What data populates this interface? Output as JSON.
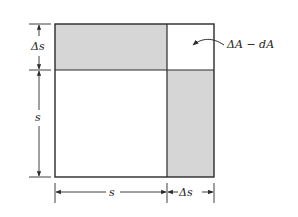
{
  "figure": {
    "colors": {
      "line": "#2a2a2a",
      "shade": "#d6d6d6",
      "background": "#ffffff"
    },
    "labels": {
      "left_top": "Δs",
      "left_main": "s",
      "bottom_main": "s",
      "bottom_right": "Δs",
      "annotation": "ΔA − dA"
    },
    "regions": [
      {
        "name": "main-square",
        "shaded": false
      },
      {
        "name": "top-strip",
        "shaded": true
      },
      {
        "name": "right-strip",
        "shaded": true
      },
      {
        "name": "corner-square",
        "shaded": false
      }
    ]
  }
}
